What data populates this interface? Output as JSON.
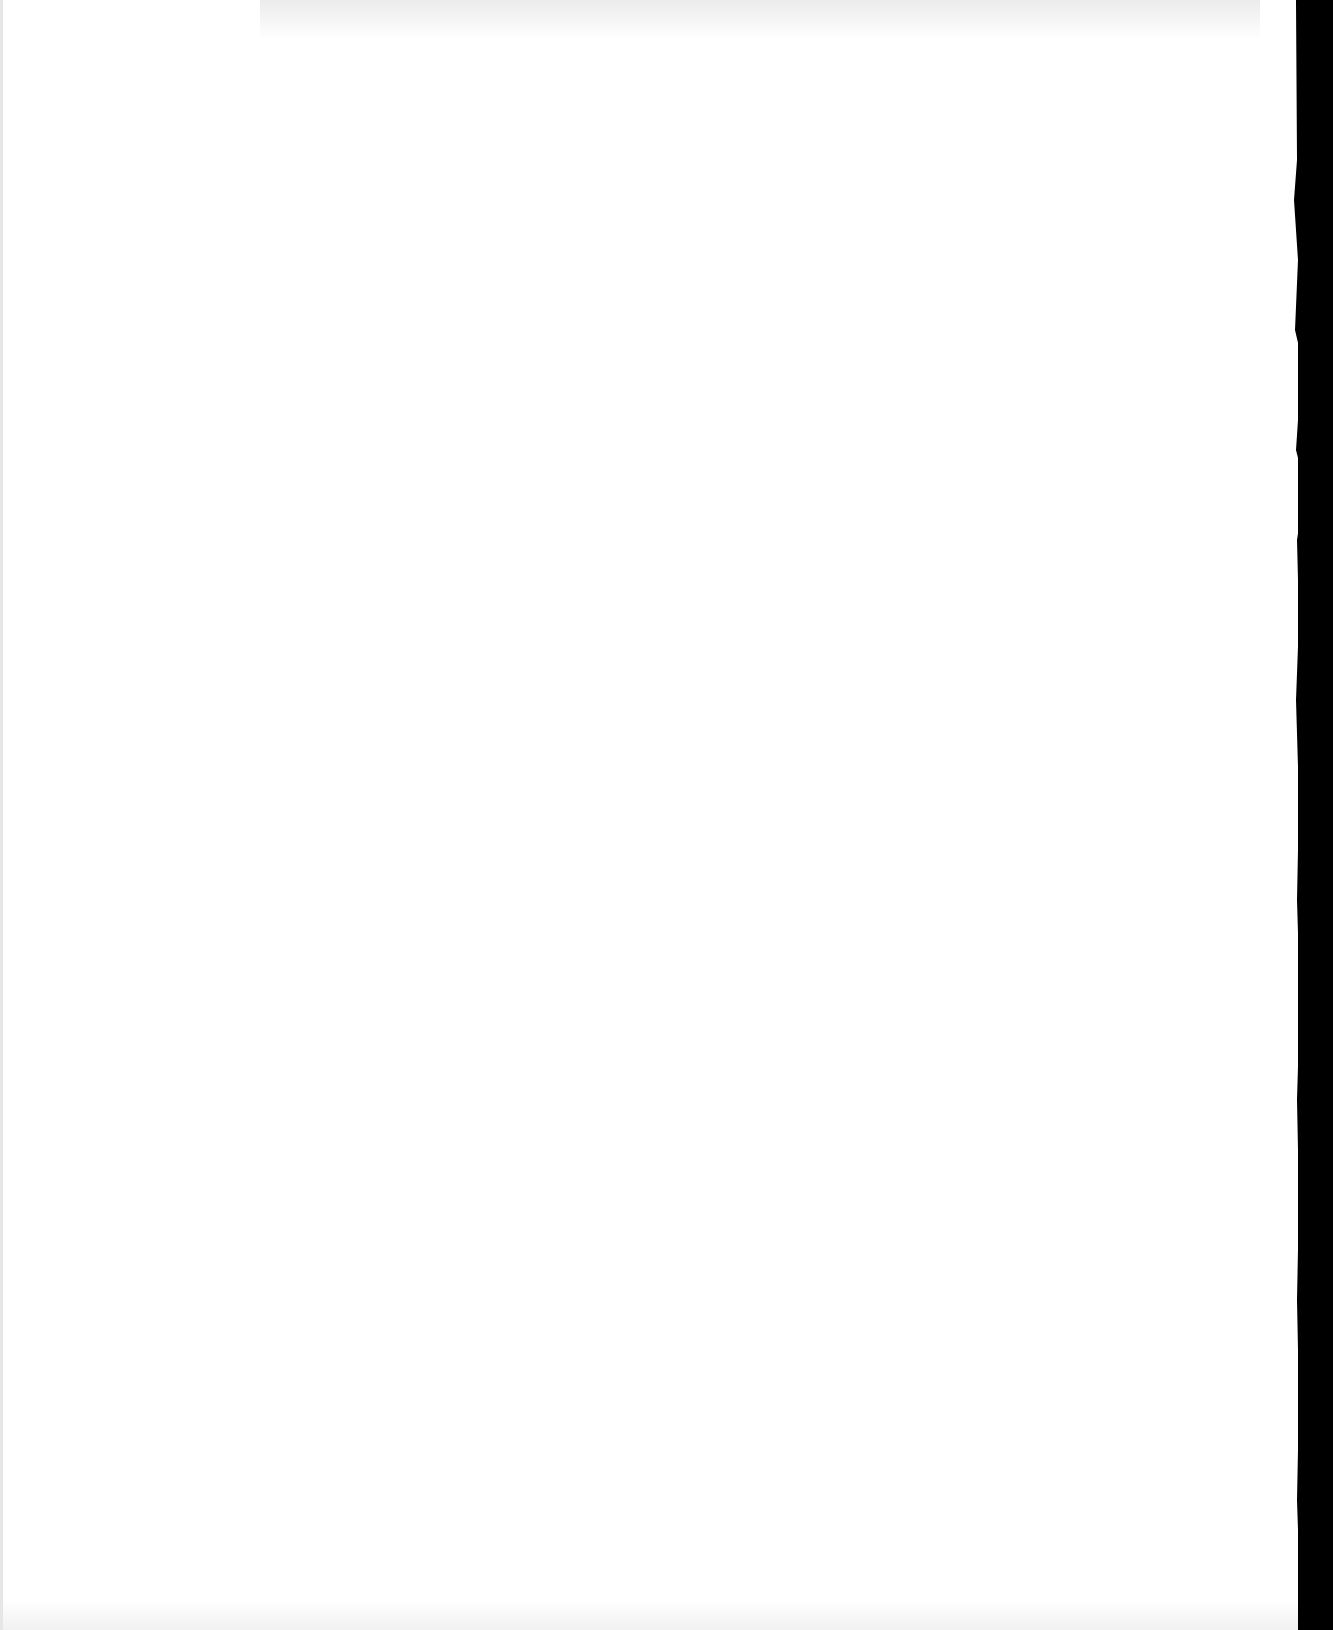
{
  "document": {
    "type": "blank scanned page",
    "text_content": "",
    "colors": {
      "paper": "#ffffff",
      "background": "#000000"
    }
  }
}
